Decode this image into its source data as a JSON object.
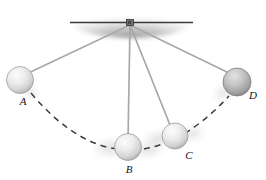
{
  "figure": {
    "background_color": "#ffffff",
    "width": 266,
    "height": 180
  },
  "ceiling": {
    "name": "ceiling-support",
    "line_color": "#3a3a3a",
    "shadow_color": "#9a9a9a",
    "x_start": 70,
    "x_end": 193,
    "y": 22
  },
  "pivot": {
    "name": "pivot-point",
    "x": 130,
    "y": 23,
    "color": "#4a4a4a"
  },
  "strings": {
    "color": "#a8a8a8",
    "width": 1.6,
    "items": [
      {
        "label": "string-to-A",
        "x1": 130,
        "y1": 24,
        "x2": 22,
        "y2": 76
      },
      {
        "label": "string-to-B",
        "x1": 130,
        "y1": 24,
        "x2": 128,
        "y2": 140
      },
      {
        "label": "string-to-C",
        "x1": 130,
        "y1": 24,
        "x2": 172,
        "y2": 131
      },
      {
        "label": "string-to-D",
        "x1": 130,
        "y1": 24,
        "x2": 231,
        "y2": 74
      }
    ]
  },
  "balls": [
    {
      "id": "A",
      "label": "A",
      "cx": 20,
      "cy": 80,
      "r": 13.5,
      "shade": "light",
      "label_x": 23,
      "label_y": 105
    },
    {
      "id": "B",
      "label": "B",
      "cx": 128,
      "cy": 147,
      "r": 13.5,
      "shade": "light",
      "label_x": 129,
      "label_y": 173
    },
    {
      "id": "C",
      "label": "C",
      "cx": 175,
      "cy": 136,
      "r": 13.0,
      "shade": "light",
      "label_x": 189,
      "label_y": 159
    },
    {
      "id": "D",
      "label": "D",
      "cx": 237,
      "cy": 82,
      "r": 14.0,
      "shade": "dark",
      "label_x": 253,
      "label_y": 99
    }
  ],
  "arc": {
    "name": "swing-path-arc",
    "style": "dashed",
    "color": "#3c3c3c",
    "dash": "6 5",
    "path": "M 31 93 Q 78 148 128 150 Q 178 151 229 97"
  },
  "motion_blur": {
    "color": "#dcdcdc",
    "streaks": [
      {
        "cx": 112,
        "cy": 148,
        "rx": 23,
        "ry": 11,
        "rot": -4
      },
      {
        "cx": 147,
        "cy": 150,
        "rx": 18,
        "ry": 9,
        "rot": -4
      },
      {
        "cx": 160,
        "cy": 139,
        "rx": 20,
        "ry": 10,
        "rot": -12
      },
      {
        "cx": 192,
        "cy": 135,
        "rx": 14,
        "ry": 8,
        "rot": -12
      },
      {
        "cx": 222,
        "cy": 92,
        "rx": 12,
        "ry": 8,
        "rot": -35
      }
    ]
  },
  "colors": {
    "ball_highlight": "#fbfbfb",
    "ball_mid": "#d9d9d9",
    "ball_edge": "#9d9d9d",
    "ball_dark_highlight": "#dcdcdc",
    "ball_dark_mid": "#b4b4b4",
    "ball_dark_edge": "#7b7b7b",
    "line": "#3c3c3c"
  }
}
